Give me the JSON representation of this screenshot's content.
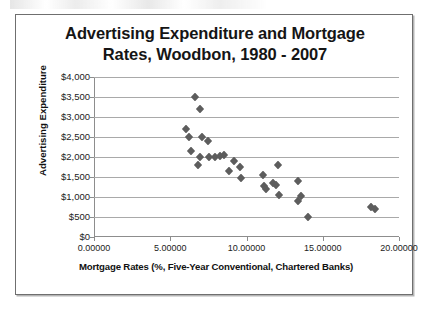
{
  "chart_data": {
    "type": "scatter",
    "title": "Advertising Expenditure and Mortgage Rates, Woodbon, 1980 - 2007",
    "title_line1": "Advertising Expenditure and Mortgage",
    "title_line2": "Rates, Woodbon, 1980 - 2007",
    "xlabel": "Mortgage Rates (%, Five-Year Conventional, Chartered Banks)",
    "ylabel": "Advertising Expenditure",
    "xlim": [
      0,
      20
    ],
    "ylim": [
      0,
      4000
    ],
    "grid": "horizontal",
    "legend": "none",
    "marker": "diamond",
    "marker_color": "#5d5d5d",
    "x_ticks": [
      0,
      5,
      10,
      15,
      20
    ],
    "x_tick_labels": [
      "0.00000",
      "5.00000",
      "10.00000",
      "15.00000",
      "20.00000"
    ],
    "y_ticks": [
      0,
      500,
      1000,
      1500,
      2000,
      2500,
      3000,
      3500,
      4000
    ],
    "y_tick_labels": [
      "$0",
      "$500",
      "$1,000",
      "$1,500",
      "$2,000",
      "$2,500",
      "$3,000",
      "$3,500",
      "$4,000"
    ],
    "points": [
      {
        "x": 6.65,
        "y": 3500
      },
      {
        "x": 6.95,
        "y": 3200
      },
      {
        "x": 6.05,
        "y": 2700
      },
      {
        "x": 6.25,
        "y": 2500
      },
      {
        "x": 7.05,
        "y": 2500
      },
      {
        "x": 7.45,
        "y": 2400
      },
      {
        "x": 6.35,
        "y": 2150
      },
      {
        "x": 6.95,
        "y": 2000
      },
      {
        "x": 7.55,
        "y": 2000
      },
      {
        "x": 7.95,
        "y": 2000
      },
      {
        "x": 8.25,
        "y": 2020
      },
      {
        "x": 8.55,
        "y": 2050
      },
      {
        "x": 6.85,
        "y": 1800
      },
      {
        "x": 9.15,
        "y": 1900
      },
      {
        "x": 8.85,
        "y": 1650
      },
      {
        "x": 9.55,
        "y": 1750
      },
      {
        "x": 9.65,
        "y": 1480
      },
      {
        "x": 11.05,
        "y": 1560
      },
      {
        "x": 11.15,
        "y": 1280
      },
      {
        "x": 11.25,
        "y": 1200
      },
      {
        "x": 11.75,
        "y": 1340
      },
      {
        "x": 11.95,
        "y": 1310
      },
      {
        "x": 12.05,
        "y": 1790
      },
      {
        "x": 12.15,
        "y": 1060
      },
      {
        "x": 13.35,
        "y": 1390
      },
      {
        "x": 13.35,
        "y": 900
      },
      {
        "x": 13.55,
        "y": 1030
      },
      {
        "x": 14.05,
        "y": 490
      },
      {
        "x": 18.15,
        "y": 750
      },
      {
        "x": 18.45,
        "y": 700
      }
    ]
  }
}
